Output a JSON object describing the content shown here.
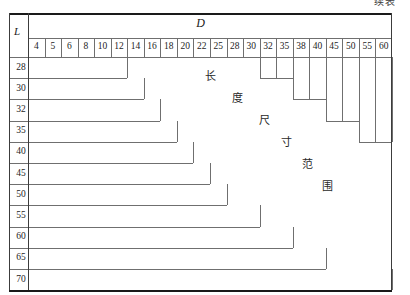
{
  "page": {
    "continued_label": "续表"
  },
  "table": {
    "row_axis_label": "L",
    "column_axis_label": "D",
    "columns": [
      "4",
      "5",
      "6",
      "8",
      "10",
      "12",
      "14",
      "16",
      "18",
      "20",
      "22",
      "25",
      "28",
      "30",
      "32",
      "35",
      "38",
      "40",
      "45",
      "50",
      "55",
      "60"
    ],
    "rows": [
      "28",
      "30",
      "32",
      "35",
      "40",
      "45",
      "50",
      "55",
      "60",
      "65",
      "70"
    ],
    "annotation_chars": [
      "长",
      "度",
      "尺",
      "寸",
      "范",
      "围"
    ],
    "annotation_text": "长度尺寸范围",
    "left_staircase_end_index": [
      6,
      7,
      8,
      9,
      10,
      11,
      12,
      14,
      16,
      18,
      22
    ],
    "right_staircase": [
      {
        "from_index": 14,
        "to_index": 16,
        "end_row_index": 0
      },
      {
        "from_index": 16,
        "to_index": 18,
        "end_row_index": 1
      },
      {
        "from_index": 18,
        "to_index": 20,
        "end_row_index": 2
      },
      {
        "from_index": 20,
        "to_index": 22,
        "end_row_index": 3
      }
    ],
    "colors": {
      "frame": "#1a1a1a",
      "grid": "#6f6f6f",
      "text": "#1d1d1d",
      "background": "#ffffff"
    }
  }
}
